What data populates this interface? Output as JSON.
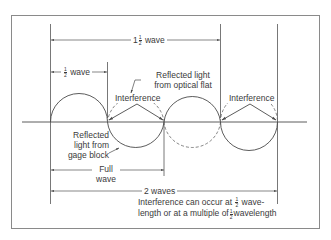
{
  "diagram": {
    "labels": {
      "one_and_half_wave": {
        "whole": "1",
        "num": "1",
        "den": "2",
        "text": "wave"
      },
      "half_wave": {
        "num": "1",
        "den": "2",
        "text": "wave"
      },
      "reflected_optical_flat": [
        "Reflected light",
        "from optical flat"
      ],
      "interference_1": "Interference",
      "interference_2": "Interference",
      "reflected_gage_block": [
        "Reflected",
        "light from",
        "gage block"
      ],
      "full_wave": [
        "Full",
        "wave"
      ],
      "two_waves": "2 waves",
      "note": {
        "line1_pre": "Interference can occur at",
        "line1_num": "1",
        "line1_den": "2",
        "line1_post": "wave-",
        "line2_pre": "length or at a multiple of",
        "line2_num": "1",
        "line2_den": "2",
        "line2_post": "wavelength"
      }
    },
    "colors": {
      "line": "#4a4a4a",
      "border": "#8a8a8a",
      "background": "#ffffff"
    }
  }
}
